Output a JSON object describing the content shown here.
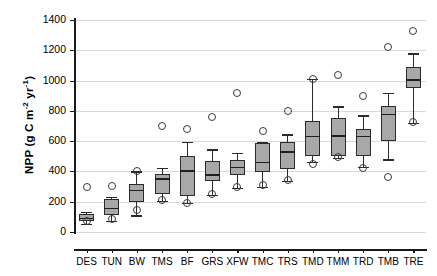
{
  "chart_data": {
    "type": "box",
    "title": "",
    "xlabel": "",
    "ylabel": "NPP (g C m⁻² yr⁻¹)",
    "ylabel_parts": {
      "prefix": "NPP (g C m",
      "sup1": "-2",
      "mid": " yr",
      "sup2": "-1",
      "suffix": ")"
    },
    "ylim": [
      0,
      1400
    ],
    "yticks": [
      0,
      200,
      400,
      600,
      800,
      1000,
      1200,
      1400
    ],
    "ytick_labels": [
      "0",
      "200",
      "400",
      "600",
      "800",
      "1000",
      "1200",
      "1400"
    ],
    "grid": true,
    "grid_color": "#d9d9d9",
    "box_fill": "#a8a8a8",
    "box_edge": "#2b2b2b",
    "categories": [
      "DES",
      "TUN",
      "BW",
      "TMS",
      "BF",
      "GRS",
      "XFW",
      "TMC",
      "TRS",
      "TMD",
      "TMM",
      "TRD",
      "TMB",
      "TRE"
    ],
    "boxes": [
      {
        "category": "DES",
        "whisker_low": 55,
        "q1": 75,
        "median": 95,
        "q3": 120,
        "whisker_high": 135,
        "outliers": [
          295,
          70
        ]
      },
      {
        "category": "TUN",
        "whisker_low": 75,
        "q1": 115,
        "median": 160,
        "q3": 215,
        "whisker_high": 230,
        "outliers": [
          305,
          85
        ]
      },
      {
        "category": "BW",
        "whisker_low": 110,
        "q1": 195,
        "median": 280,
        "q3": 315,
        "whisker_high": 400,
        "outliers": [
          400,
          145
        ]
      },
      {
        "category": "TMS",
        "whisker_low": 205,
        "q1": 250,
        "median": 355,
        "q3": 380,
        "whisker_high": 425,
        "outliers": [
          700,
          210
        ]
      },
      {
        "category": "BF",
        "whisker_low": 190,
        "q1": 235,
        "median": 410,
        "q3": 505,
        "whisker_high": 595,
        "outliers": [
          680,
          190
        ]
      },
      {
        "category": "GRS",
        "whisker_low": 245,
        "q1": 335,
        "median": 380,
        "q3": 470,
        "whisker_high": 545,
        "outliers": [
          760,
          250
        ]
      },
      {
        "category": "XFW",
        "whisker_low": 290,
        "q1": 375,
        "median": 430,
        "q3": 475,
        "whisker_high": 525,
        "outliers": [
          915,
          300
        ]
      },
      {
        "category": "TMC",
        "whisker_low": 300,
        "q1": 395,
        "median": 465,
        "q3": 585,
        "whisker_high": 595,
        "outliers": [
          665,
          310
        ]
      },
      {
        "category": "TRS",
        "whisker_low": 340,
        "q1": 415,
        "median": 535,
        "q3": 595,
        "whisker_high": 645,
        "outliers": [
          800,
          345
        ]
      },
      {
        "category": "TMD",
        "whisker_low": 465,
        "q1": 505,
        "median": 635,
        "q3": 735,
        "whisker_high": 1010,
        "outliers": [
          1010,
          450
        ]
      },
      {
        "category": "TMM",
        "whisker_low": 490,
        "q1": 500,
        "median": 640,
        "q3": 750,
        "whisker_high": 830,
        "outliers": [
          1040,
          495
        ]
      },
      {
        "category": "TRD",
        "whisker_low": 430,
        "q1": 500,
        "median": 635,
        "q3": 680,
        "whisker_high": 770,
        "outliers": [
          900,
          425
        ]
      },
      {
        "category": "TMB",
        "whisker_low": 480,
        "q1": 600,
        "median": 780,
        "q3": 830,
        "whisker_high": 920,
        "outliers": [
          1225,
          360
        ]
      },
      {
        "category": "TRE",
        "whisker_low": 720,
        "q1": 950,
        "median": 1010,
        "q3": 1090,
        "whisker_high": 1180,
        "outliers": [
          1330,
          725
        ]
      }
    ]
  }
}
